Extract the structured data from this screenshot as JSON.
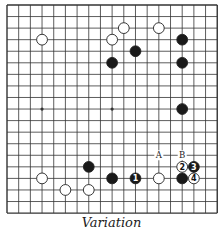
{
  "diagram": {
    "type": "go-board",
    "size": 19,
    "grid": {
      "x0": 7,
      "y0": 5,
      "dx": 11.68,
      "dy": 11.56
    },
    "hoshi": [
      [
        3,
        3
      ],
      [
        3,
        9
      ],
      [
        3,
        15
      ],
      [
        9,
        3
      ],
      [
        9,
        9
      ],
      [
        9,
        15
      ],
      [
        15,
        3
      ],
      [
        15,
        9
      ],
      [
        15,
        15
      ]
    ],
    "colors": {
      "line": "#333333",
      "black": "#1a1a1a",
      "white": "#ffffff",
      "stone_outline": "#222222"
    },
    "stones": [
      {
        "color": "white",
        "col": 3,
        "row": 3
      },
      {
        "color": "white",
        "col": 10,
        "row": 2
      },
      {
        "color": "white",
        "col": 13,
        "row": 2
      },
      {
        "color": "white",
        "col": 9,
        "row": 3
      },
      {
        "color": "black",
        "col": 15,
        "row": 3
      },
      {
        "color": "black",
        "col": 11,
        "row": 4
      },
      {
        "color": "black",
        "col": 9,
        "row": 5
      },
      {
        "color": "black",
        "col": 15,
        "row": 5
      },
      {
        "color": "black",
        "col": 15,
        "row": 9
      },
      {
        "color": "black",
        "col": 7,
        "row": 14
      },
      {
        "color": "white",
        "col": 3,
        "row": 15
      },
      {
        "color": "black",
        "col": 9,
        "row": 15
      },
      {
        "color": "black",
        "col": 11,
        "row": 15,
        "label": "1"
      },
      {
        "color": "white",
        "col": 13,
        "row": 15
      },
      {
        "color": "black",
        "col": 15,
        "row": 15
      },
      {
        "color": "white",
        "col": 15,
        "row": 14,
        "label": "2"
      },
      {
        "color": "black",
        "col": 16,
        "row": 14,
        "label": "3"
      },
      {
        "color": "white",
        "col": 16,
        "row": 15,
        "label": "4"
      },
      {
        "color": "white",
        "col": 5,
        "row": 16
      },
      {
        "color": "white",
        "col": 7,
        "row": 16
      }
    ],
    "markers": [
      {
        "label": "A",
        "col": 13,
        "row": 13
      },
      {
        "label": "B",
        "col": 15,
        "row": 13
      }
    ]
  },
  "caption": "Variation"
}
